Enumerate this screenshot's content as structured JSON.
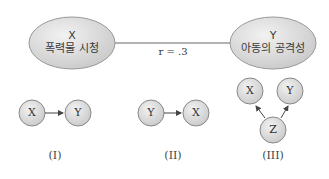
{
  "top": {
    "left_ellipse": {
      "var": "X",
      "label": "폭력물 시청"
    },
    "right_ellipse": {
      "var": "Y",
      "label": "아동의 공격성"
    },
    "correlation": "r = .3"
  },
  "models": [
    {
      "caption": "(I)",
      "nodes": [
        "X",
        "Y"
      ],
      "relation": "X → Y"
    },
    {
      "caption": "(II)",
      "nodes": [
        "Y",
        "X"
      ],
      "relation": "Y → X"
    },
    {
      "caption": "(III)",
      "nodes": [
        "X",
        "Y",
        "Z"
      ],
      "relation": "Z → X, Z → Y"
    }
  ],
  "colors": {
    "node_fill": "#dcdcdc",
    "node_stroke": "#8a8a8a",
    "line": "#555555"
  }
}
